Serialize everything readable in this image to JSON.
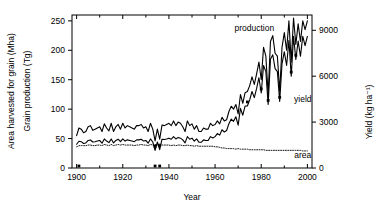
{
  "chart_data": {
    "type": "line",
    "title": "",
    "xlabel": "Year",
    "ylabel_left_1": "Area harvested for grain (Mha)",
    "ylabel_left_2": "Grain production (Tg)",
    "ylabel_right": "Yield (kg ha⁻¹)",
    "xlim": [
      1898,
      2002
    ],
    "ylim_left": [
      0,
      260
    ],
    "ylim_right": [
      0,
      10000
    ],
    "xticks": [
      1900,
      1920,
      1940,
      1960,
      1980,
      2000
    ],
    "xticklabels": [
      "1900",
      "1920",
      "1940",
      "1960",
      "1980",
      "2000"
    ],
    "yticks_left": [
      0,
      50,
      100,
      150,
      200,
      250
    ],
    "yticklabels_left": [
      "0",
      "50",
      "100",
      "150",
      "200",
      "250"
    ],
    "yticks_right": [
      0,
      3000,
      6000,
      9000
    ],
    "yticklabels_right": [
      "0",
      "3000",
      "6000",
      "9000"
    ],
    "grid": false,
    "legend_position": "inline-annotations",
    "annotations": [
      {
        "text": "production",
        "x": 1977,
        "y": 232,
        "axis": "left"
      },
      {
        "text": "yield",
        "x": 1998,
        "y": 112,
        "axis": "left"
      },
      {
        "text": "area",
        "x": 1998,
        "y": 17,
        "axis": "left"
      }
    ],
    "series": [
      {
        "name": "production",
        "style": "solid",
        "axis": "left",
        "unit": "Tg",
        "x": [
          1900,
          1901,
          1902,
          1903,
          1904,
          1905,
          1906,
          1907,
          1908,
          1909,
          1910,
          1911,
          1912,
          1913,
          1914,
          1915,
          1916,
          1917,
          1918,
          1919,
          1920,
          1921,
          1922,
          1923,
          1924,
          1925,
          1926,
          1927,
          1928,
          1929,
          1930,
          1931,
          1932,
          1933,
          1934,
          1935,
          1936,
          1937,
          1938,
          1939,
          1940,
          1941,
          1942,
          1943,
          1944,
          1945,
          1946,
          1947,
          1948,
          1949,
          1950,
          1951,
          1952,
          1953,
          1954,
          1955,
          1956,
          1957,
          1958,
          1959,
          1960,
          1961,
          1962,
          1963,
          1964,
          1965,
          1966,
          1967,
          1968,
          1969,
          1970,
          1971,
          1972,
          1973,
          1974,
          1975,
          1976,
          1977,
          1978,
          1979,
          1980,
          1981,
          1982,
          1983,
          1984,
          1985,
          1986,
          1987,
          1988,
          1989,
          1990,
          1991,
          1992,
          1993,
          1994,
          1995,
          1996,
          1997,
          1998,
          1999,
          2000
        ],
        "values": [
          55,
          68,
          66,
          60,
          62,
          70,
          72,
          64,
          66,
          68,
          70,
          62,
          75,
          68,
          63,
          76,
          62,
          70,
          74,
          66,
          76,
          68,
          72,
          70,
          68,
          66,
          72,
          72,
          74,
          68,
          70,
          62,
          76,
          66,
          46,
          66,
          49,
          73,
          72,
          74,
          76,
          72,
          80,
          72,
          78,
          76,
          70,
          62,
          80,
          72,
          75,
          66,
          72,
          62,
          62,
          68,
          66,
          66,
          76,
          72,
          74,
          80,
          75,
          86,
          80,
          82,
          96,
          105,
          100,
          108,
          92,
          125,
          110,
          128,
          130,
          140,
          155,
          142,
          160,
          180,
          150,
          205,
          190,
          125,
          215,
          225,
          195,
          190,
          130,
          205,
          230,
          200,
          250,
          180,
          255,
          210,
          245,
          215,
          250,
          235,
          250
        ]
      },
      {
        "name": "yield",
        "style": "solid",
        "axis": "right",
        "unit": "kg ha-1",
        "x": [
          1900,
          1901,
          1902,
          1903,
          1904,
          1905,
          1906,
          1907,
          1908,
          1909,
          1910,
          1911,
          1912,
          1913,
          1914,
          1915,
          1916,
          1917,
          1918,
          1919,
          1920,
          1921,
          1922,
          1923,
          1924,
          1925,
          1926,
          1927,
          1928,
          1929,
          1930,
          1931,
          1932,
          1933,
          1934,
          1935,
          1936,
          1937,
          1938,
          1939,
          1940,
          1941,
          1942,
          1943,
          1944,
          1945,
          1946,
          1947,
          1948,
          1949,
          1950,
          1951,
          1952,
          1953,
          1954,
          1955,
          1956,
          1957,
          1958,
          1959,
          1960,
          1961,
          1962,
          1963,
          1964,
          1965,
          1966,
          1967,
          1968,
          1969,
          1970,
          1971,
          1972,
          1973,
          1974,
          1975,
          1976,
          1977,
          1978,
          1979,
          1980,
          1981,
          1982,
          1983,
          1984,
          1985,
          1986,
          1987,
          1988,
          1989,
          1990,
          1991,
          1992,
          1993,
          1994,
          1995,
          1996,
          1997,
          1998,
          1999,
          2000
        ],
        "values": [
          1550,
          1750,
          1720,
          1600,
          1640,
          1800,
          1830,
          1700,
          1720,
          1760,
          1800,
          1620,
          1900,
          1760,
          1660,
          1900,
          1640,
          1800,
          1880,
          1720,
          1900,
          1760,
          1840,
          1800,
          1760,
          1720,
          1840,
          1840,
          1880,
          1760,
          1800,
          1620,
          1900,
          1700,
          1150,
          1700,
          1200,
          1880,
          1860,
          1900,
          1950,
          1880,
          2050,
          1900,
          2000,
          1950,
          1840,
          1640,
          2050,
          1880,
          1950,
          1760,
          1900,
          1680,
          1680,
          1840,
          1800,
          1800,
          2050,
          1960,
          2050,
          2250,
          2150,
          2500,
          2350,
          2450,
          2900,
          3200,
          3050,
          3350,
          2800,
          3900,
          3450,
          4050,
          4050,
          4450,
          5000,
          4600,
          5200,
          5900,
          4900,
          6700,
          6300,
          4150,
          7100,
          7400,
          6500,
          6300,
          4350,
          6800,
          7600,
          6700,
          8350,
          6000,
          8600,
          7100,
          8300,
          7300,
          8600,
          8000,
          8600
        ]
      },
      {
        "name": "area",
        "style": "dotted",
        "axis": "left",
        "unit": "Mha",
        "x": [
          1900,
          1901,
          1902,
          1903,
          1904,
          1905,
          1906,
          1907,
          1908,
          1909,
          1910,
          1911,
          1912,
          1913,
          1914,
          1915,
          1916,
          1917,
          1918,
          1919,
          1920,
          1921,
          1922,
          1923,
          1924,
          1925,
          1926,
          1927,
          1928,
          1929,
          1930,
          1931,
          1932,
          1933,
          1934,
          1935,
          1936,
          1937,
          1938,
          1939,
          1940,
          1941,
          1942,
          1943,
          1944,
          1945,
          1946,
          1947,
          1948,
          1949,
          1950,
          1951,
          1952,
          1953,
          1954,
          1955,
          1956,
          1957,
          1958,
          1959,
          1960,
          1961,
          1962,
          1963,
          1964,
          1965,
          1966,
          1967,
          1968,
          1969,
          1970,
          1971,
          1972,
          1973,
          1974,
          1975,
          1976,
          1977,
          1978,
          1979,
          1980,
          1981,
          1982,
          1983,
          1984,
          1985,
          1986,
          1987,
          1988,
          1989,
          1990,
          1991,
          1992,
          1993,
          1994,
          1995,
          1996,
          1997,
          1998,
          1999,
          2000
        ],
        "values": [
          36,
          38,
          38,
          38,
          38,
          39,
          39,
          38,
          38,
          39,
          39,
          38,
          40,
          39,
          38,
          40,
          38,
          39,
          40,
          39,
          40,
          39,
          39,
          39,
          39,
          38,
          39,
          39,
          40,
          39,
          39,
          38,
          40,
          39,
          40,
          39,
          41,
          39,
          39,
          39,
          39,
          38,
          39,
          38,
          39,
          39,
          38,
          38,
          39,
          38,
          38,
          37,
          38,
          37,
          37,
          37,
          37,
          37,
          37,
          37,
          36,
          36,
          35,
          34,
          34,
          33,
          33,
          33,
          33,
          32,
          33,
          32,
          32,
          32,
          32,
          31,
          31,
          31,
          31,
          31,
          31,
          31,
          30,
          30,
          30,
          30,
          30,
          30,
          30,
          30,
          30,
          30,
          30,
          30,
          30,
          30,
          30,
          30,
          29,
          29,
          29
        ]
      }
    ],
    "markers": {
      "name": "drought-year-markers",
      "description": "small filled squares marking low-yield years",
      "points_yield": [
        {
          "x": 1934,
          "y": 1150
        },
        {
          "x": 1936,
          "y": 1200
        },
        {
          "x": 1974,
          "y": 4050
        },
        {
          "x": 1980,
          "y": 4900
        },
        {
          "x": 1983,
          "y": 4150
        },
        {
          "x": 1988,
          "y": 4350
        },
        {
          "x": 1993,
          "y": 6000
        },
        {
          "x": 1995,
          "y": 7100
        }
      ],
      "points_baseline": [
        {
          "x": 1901,
          "y": 0
        },
        {
          "x": 1934,
          "y": 0
        },
        {
          "x": 1936,
          "y": 0
        }
      ]
    }
  }
}
